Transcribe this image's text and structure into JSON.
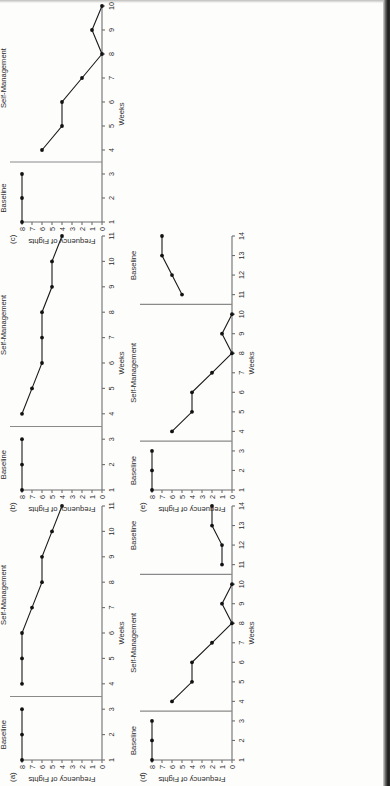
{
  "document": {
    "kind": "scanned-figure-page",
    "orientation": "rotated-90-ccw",
    "ink_color": "#1a1a1a",
    "axis_color": "#6e6e6e",
    "phase_line_color": "#8a8a8a"
  },
  "bleed_text": [
    "",
    "",
    ""
  ],
  "common": {
    "ylabel": "Frequency of Fights",
    "xlabel": "Weeks",
    "y_ticks": [
      "0",
      "1",
      "2",
      "3",
      "4",
      "5",
      "6",
      "7",
      "8"
    ],
    "phase_baseline": "Baseline",
    "phase_self_management": "Self-Management"
  },
  "chart_data": [
    {
      "id": "a",
      "panel_label": "(a)",
      "type": "line",
      "title": "",
      "xlabel": "Weeks",
      "ylabel": "Frequency of Fights",
      "xlim": [
        1,
        11
      ],
      "ylim": [
        0,
        8
      ],
      "x_ticks": [
        1,
        2,
        3,
        4,
        5,
        6,
        7,
        8,
        9,
        10,
        11
      ],
      "y_ticks": [
        0,
        1,
        2,
        3,
        4,
        5,
        6,
        7,
        8
      ],
      "grid": false,
      "legend": "none",
      "phase_change_lines": [
        3.5
      ],
      "phases": [
        {
          "name": "Baseline",
          "label_x": 2,
          "x": [
            1,
            2,
            3
          ],
          "values": [
            8,
            8,
            8
          ]
        },
        {
          "name": "Self-Management",
          "label_x": 7.5,
          "x": [
            4,
            5,
            6,
            7,
            8,
            9,
            10,
            11
          ],
          "values": [
            8,
            8,
            8,
            7,
            6,
            6,
            5,
            4
          ]
        }
      ]
    },
    {
      "id": "b",
      "panel_label": "(b)",
      "type": "line",
      "title": "",
      "xlabel": "Weeks",
      "ylabel": "Frequency of Fights",
      "xlim": [
        1,
        11
      ],
      "ylim": [
        0,
        8
      ],
      "x_ticks": [
        1,
        2,
        3,
        4,
        5,
        6,
        7,
        8,
        9,
        10,
        11
      ],
      "y_ticks": [
        0,
        1,
        2,
        3,
        4,
        5,
        6,
        7,
        8
      ],
      "grid": false,
      "legend": "none",
      "phase_change_lines": [
        3.5
      ],
      "phases": [
        {
          "name": "Baseline",
          "label_x": 2,
          "x": [
            1,
            2,
            3
          ],
          "values": [
            8,
            8,
            8
          ]
        },
        {
          "name": "Self-Management",
          "label_x": 7.5,
          "x": [
            4,
            5,
            6,
            7,
            8,
            9,
            10,
            11
          ],
          "values": [
            8,
            7,
            6,
            6,
            6,
            5,
            5,
            4
          ]
        }
      ]
    },
    {
      "id": "c",
      "panel_label": "(c)",
      "type": "line",
      "title": "",
      "xlabel": "Weeks",
      "ylabel": "Frequency of Fights",
      "xlim": [
        1,
        10
      ],
      "ylim": [
        0,
        8
      ],
      "x_ticks": [
        1,
        2,
        3,
        4,
        5,
        6,
        7,
        8,
        9,
        10
      ],
      "y_ticks": [
        0,
        1,
        2,
        3,
        4,
        5,
        6,
        7,
        8
      ],
      "grid": false,
      "legend": "none",
      "phase_change_lines": [
        3.5
      ],
      "phases": [
        {
          "name": "Baseline",
          "label_x": 2,
          "x": [
            1,
            2,
            3
          ],
          "values": [
            8,
            8,
            8
          ]
        },
        {
          "name": "Self-Management",
          "label_x": 7,
          "x": [
            4,
            5,
            6,
            7,
            8,
            9,
            10
          ],
          "values": [
            6,
            4,
            4,
            2,
            0,
            1,
            0
          ]
        }
      ]
    },
    {
      "id": "d",
      "panel_label": "(d)",
      "type": "line",
      "title": "",
      "xlabel": "Weeks",
      "ylabel": "Frequency of Fights",
      "xlim": [
        1,
        14
      ],
      "ylim": [
        0,
        8
      ],
      "x_ticks": [
        1,
        2,
        3,
        4,
        5,
        6,
        7,
        8,
        9,
        10,
        11,
        12,
        13,
        14
      ],
      "y_ticks": [
        0,
        1,
        2,
        3,
        4,
        5,
        6,
        7,
        8
      ],
      "grid": false,
      "legend": "none",
      "phase_change_lines": [
        3.5,
        10.5
      ],
      "phases": [
        {
          "name": "Baseline",
          "label_x": 2,
          "x": [
            1,
            2,
            3
          ],
          "values": [
            8,
            8,
            8
          ]
        },
        {
          "name": "Self-Management",
          "label_x": 7,
          "x": [
            4,
            5,
            6,
            7,
            8,
            9,
            10
          ],
          "values": [
            6,
            4,
            4,
            2,
            0,
            1,
            0
          ]
        },
        {
          "name": "Baseline",
          "label_x": 12.5,
          "x": [
            11,
            12,
            13,
            14
          ],
          "values": [
            1,
            1,
            2,
            2
          ]
        }
      ]
    },
    {
      "id": "e",
      "panel_label": "(e)",
      "type": "line",
      "title": "",
      "xlabel": "Weeks",
      "ylabel": "Frequency of Fights",
      "xlim": [
        1,
        14
      ],
      "ylim": [
        0,
        8
      ],
      "x_ticks": [
        1,
        2,
        3,
        4,
        5,
        6,
        7,
        8,
        9,
        10,
        11,
        12,
        13,
        14
      ],
      "y_ticks": [
        0,
        1,
        2,
        3,
        4,
        5,
        6,
        7,
        8
      ],
      "grid": false,
      "legend": "none",
      "phase_change_lines": [
        3.5,
        10.5
      ],
      "phases": [
        {
          "name": "Baseline",
          "label_x": 2,
          "x": [
            1,
            2,
            3
          ],
          "values": [
            8,
            8,
            8
          ]
        },
        {
          "name": "Self-Management",
          "label_x": 7,
          "x": [
            4,
            5,
            6,
            7,
            8,
            9,
            10
          ],
          "values": [
            6,
            4,
            4,
            2,
            0,
            1,
            0
          ]
        },
        {
          "name": "Baseline",
          "label_x": 12.5,
          "x": [
            11,
            12,
            13,
            14
          ],
          "values": [
            5,
            6,
            7,
            7
          ]
        }
      ]
    }
  ],
  "panel_placement": [
    {
      "id": "a",
      "left": 0,
      "top": 786,
      "w": 286,
      "h": 128,
      "letter_left": 8,
      "letter_top": 782
    },
    {
      "id": "b",
      "left": 0,
      "top": 516,
      "w": 286,
      "h": 128,
      "letter_left": 8,
      "letter_top": 512
    },
    {
      "id": "c",
      "left": 0,
      "top": 248,
      "w": 248,
      "h": 128,
      "letter_left": 8,
      "letter_top": 244
    },
    {
      "id": "d",
      "left": 130,
      "top": 786,
      "w": 286,
      "h": 128,
      "letter_left": 138,
      "letter_top": 782
    },
    {
      "id": "e",
      "left": 130,
      "top": 516,
      "w": 286,
      "h": 128,
      "letter_left": 138,
      "letter_top": 512
    }
  ]
}
